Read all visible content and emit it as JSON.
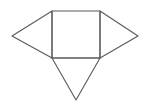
{
  "figure": {
    "background_color": "#ffffff",
    "stroke_color": "#59595b",
    "fill_color": "#ffffff",
    "stroke_width": 1.1,
    "canvas": {
      "width": 148,
      "height": 107
    },
    "shapes": [
      {
        "name": "central-square",
        "type": "square",
        "points": "52,11 100,11 100,58 52,58",
        "vertices": [
          [
            52,
            11
          ],
          [
            100,
            11
          ],
          [
            100,
            58
          ],
          [
            52,
            58
          ]
        ]
      },
      {
        "name": "left-triangle",
        "type": "triangle",
        "points": "52,11 12,36 52,58",
        "vertices": [
          [
            52,
            11
          ],
          [
            12,
            36
          ],
          [
            52,
            58
          ]
        ],
        "apex": [
          12,
          36
        ]
      },
      {
        "name": "right-triangle",
        "type": "triangle",
        "points": "100,11 138,36 100,58",
        "vertices": [
          [
            100,
            11
          ],
          [
            138,
            36
          ],
          [
            100,
            58
          ]
        ],
        "apex": [
          138,
          36
        ]
      },
      {
        "name": "bottom-triangle",
        "type": "triangle",
        "points": "52,58 100,58 76,100",
        "vertices": [
          [
            52,
            58
          ],
          [
            100,
            58
          ],
          [
            76,
            100
          ]
        ],
        "apex": [
          76,
          100
        ]
      }
    ],
    "edges": [
      {
        "name": "square-top-edge",
        "from": [
          52,
          11
        ],
        "to": [
          100,
          11
        ]
      },
      {
        "name": "square-left-edge",
        "from": [
          52,
          11
        ],
        "to": [
          52,
          58
        ]
      },
      {
        "name": "square-right-edge",
        "from": [
          100,
          11
        ],
        "to": [
          100,
          58
        ]
      },
      {
        "name": "square-bottom-edge",
        "from": [
          52,
          58
        ],
        "to": [
          100,
          58
        ]
      },
      {
        "name": "left-triangle-upper-edge",
        "from": [
          52,
          11
        ],
        "to": [
          12,
          36
        ]
      },
      {
        "name": "left-triangle-lower-edge",
        "from": [
          12,
          36
        ],
        "to": [
          52,
          58
        ]
      },
      {
        "name": "right-triangle-upper-edge",
        "from": [
          100,
          11
        ],
        "to": [
          138,
          36
        ]
      },
      {
        "name": "right-triangle-lower-edge",
        "from": [
          138,
          36
        ],
        "to": [
          100,
          58
        ]
      },
      {
        "name": "bottom-triangle-left-edge",
        "from": [
          52,
          58
        ],
        "to": [
          76,
          100
        ]
      },
      {
        "name": "bottom-triangle-right-edge",
        "from": [
          100,
          58
        ],
        "to": [
          76,
          100
        ]
      }
    ],
    "labels": []
  }
}
